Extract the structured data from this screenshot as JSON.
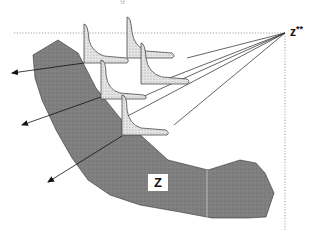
{
  "figure": {
    "caption_fragment": "g",
    "labels": {
      "ideal_point": "z",
      "ideal_point_superscript": "**",
      "region": "Z"
    },
    "colors": {
      "region_fill": "#7d7d7d",
      "slice_fill": "#e2e2e2",
      "line": "#222222",
      "guide_line": "#888888",
      "background": "#ffffff"
    },
    "elements": {
      "dotted_guides": [
        "horizontal through z**",
        "vertical through z**"
      ],
      "slice_count": 5,
      "ray_count": 5,
      "outward_arrows": 3
    }
  }
}
